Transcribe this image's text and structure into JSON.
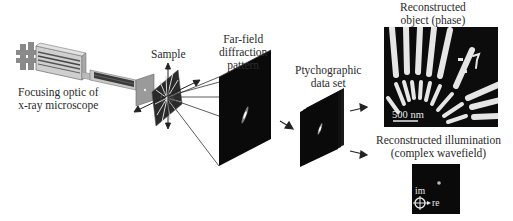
{
  "labels": {
    "optic": [
      "Focusing optic of",
      "x-ray microscope"
    ],
    "sample": "Sample",
    "farfield": [
      "Far-field",
      "diffraction",
      "pattern"
    ],
    "dataset": [
      "Ptychographic",
      "data set"
    ],
    "object": [
      "Reconstructed",
      "object (phase)"
    ],
    "illumination": [
      "Reconstructed illumination",
      "(complex wavefield)"
    ],
    "scalebar": "500 nm",
    "axis_im": "im",
    "axis_re": "re"
  },
  "colors": {
    "background": "#ffffff",
    "panel_dark": "#0a0a0a",
    "object_light": "#e8e8e8",
    "text": "#2a2a2a",
    "optic_gray": "#b5b5b5"
  }
}
